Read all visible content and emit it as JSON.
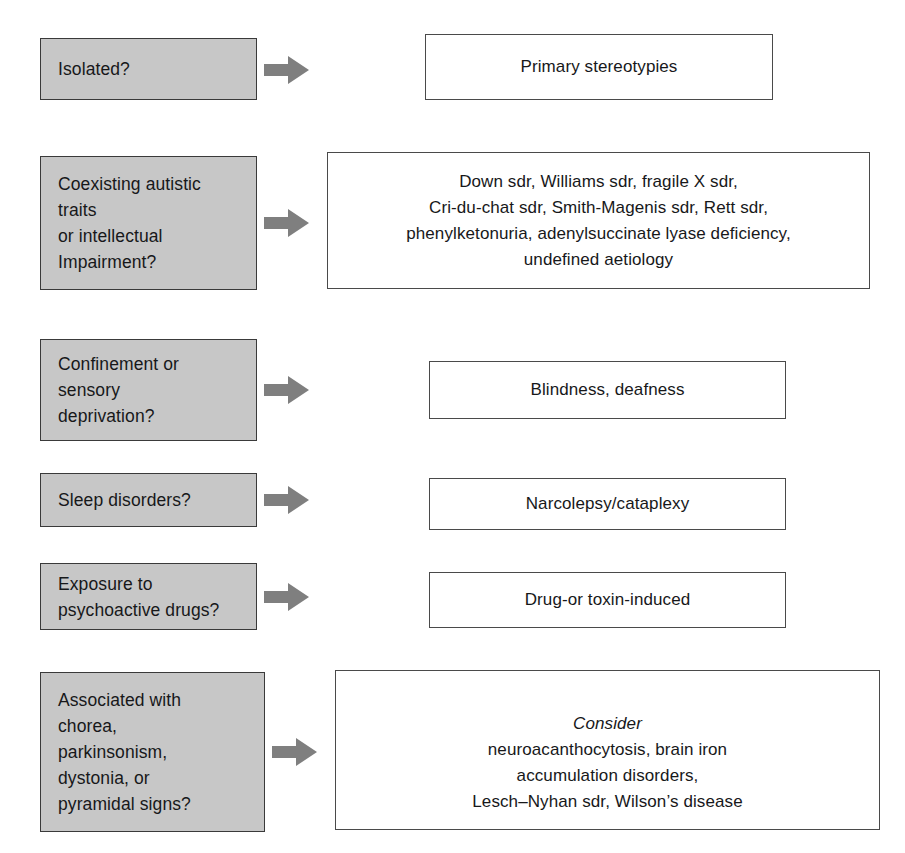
{
  "diagram": {
    "type": "flowchart",
    "title": "",
    "arrow_icon": "right-arrow-icon",
    "colors": {
      "question_fill": "#c7c7c7",
      "question_border": "#3a3a3a",
      "answer_fill": "#ffffff",
      "answer_border": "#4a4a4a",
      "arrow_fill": "#7f7f7f",
      "text": "#17181a",
      "background": "#ffffff"
    },
    "rows": [
      {
        "question": "Isolated?",
        "answer": "Primary stereotypies",
        "answer_italic_lead": ""
      },
      {
        "question": "Coexisting autistic\ntraits\nor intellectual\nImpairment?",
        "answer": "Down sdr, Williams sdr, fragile X sdr,\nCri-du-chat sdr, Smith-Magenis sdr, Rett sdr,\nphenylketonuria, adenylsuccinate lyase deficiency,\nundefined aetiology",
        "answer_italic_lead": ""
      },
      {
        "question": "Confinement or\nsensory\ndeprivation?",
        "answer": "Blindness, deafness",
        "answer_italic_lead": ""
      },
      {
        "question": "Sleep disorders?",
        "answer": "Narcolepsy/cataplexy",
        "answer_italic_lead": ""
      },
      {
        "question": "Exposure to\npsychoactive drugs?",
        "answer": "Drug-or toxin-induced",
        "answer_italic_lead": ""
      },
      {
        "question": "Associated with\nchorea,\nparkinsonism,\ndystonia, or\npyramidal signs?",
        "answer": "neuroacanthocytosis, brain iron\naccumulation disorders,\nLesch–Nyhan sdr, Wilson’s disease",
        "answer_italic_lead": "Consider"
      }
    ]
  }
}
